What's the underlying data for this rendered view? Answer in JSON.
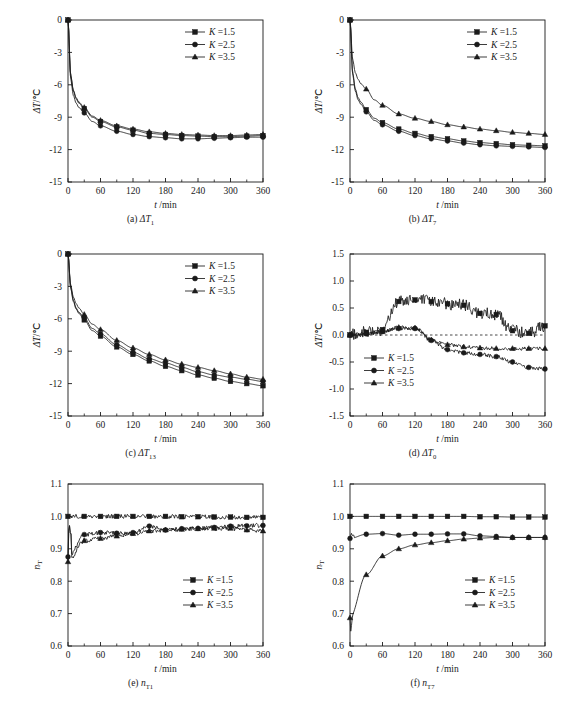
{
  "figure": {
    "width": 563,
    "height": 709,
    "background": "#ffffff",
    "line_color": "#1a1a1a"
  },
  "panels": [
    {
      "id": "a",
      "caption": "(a)",
      "caption_symbol": "ΔT",
      "caption_sub": "1",
      "xlabel_var": "t",
      "xlabel_unit": "/min",
      "ylabel_var": "ΔT",
      "ylabel_unit": "/℃",
      "xticks": [
        "0",
        "60",
        "120",
        "180",
        "240",
        "300",
        "360"
      ],
      "yticks": [
        "0",
        "-3",
        "-6",
        "-9",
        "-12",
        "-15"
      ],
      "legend": [
        "K =1.5",
        "K =2.5",
        "K =3.5"
      ],
      "legend_pos": "top-right"
    },
    {
      "id": "b",
      "caption": "(b)",
      "caption_symbol": "ΔT",
      "caption_sub": "7",
      "xlabel_var": "t",
      "xlabel_unit": "/min",
      "ylabel_var": "ΔT",
      "ylabel_unit": "/℃",
      "xticks": [
        "0",
        "60",
        "120",
        "180",
        "240",
        "300",
        "360"
      ],
      "yticks": [
        "0",
        "-3",
        "-6",
        "-9",
        "-12",
        "-15"
      ],
      "legend": [
        "K =1.5",
        "K =2.5",
        "K =3.5"
      ],
      "legend_pos": "top-right"
    },
    {
      "id": "c",
      "caption": "(c)",
      "caption_symbol": "ΔT",
      "caption_sub": "13",
      "xlabel_var": "t",
      "xlabel_unit": "/min",
      "ylabel_var": "ΔT",
      "ylabel_unit": "/℃",
      "xticks": [
        "0",
        "60",
        "120",
        "180",
        "240",
        "300",
        "360"
      ],
      "yticks": [
        "0",
        "-3",
        "-6",
        "-9",
        "-12",
        "-15"
      ],
      "legend": [
        "K =1.5",
        "K =2.5",
        "K =3.5"
      ],
      "legend_pos": "top-right"
    },
    {
      "id": "d",
      "caption": "(d)",
      "caption_symbol": "ΔT",
      "caption_sub": "0",
      "xlabel_var": "t",
      "xlabel_unit": "/min",
      "ylabel_var": "ΔT",
      "ylabel_unit": "/℃",
      "xticks": [
        "0",
        "60",
        "120",
        "180",
        "240",
        "300",
        "360"
      ],
      "yticks": [
        "1.5",
        "1.0",
        "0.5",
        "0.0",
        "-0.5",
        "-1.0",
        "-1.5"
      ],
      "legend": [
        "K =1.5",
        "K =2.5",
        "K =3.5"
      ],
      "legend_pos": "mid-left"
    },
    {
      "id": "e",
      "caption": "(e)",
      "caption_symbol": "n",
      "caption_sub": "T1",
      "xlabel_var": "t",
      "xlabel_unit": "/min",
      "ylabel_var": "n",
      "ylabel_sub": "T",
      "ylabel_unit": "",
      "xticks": [
        "0",
        "60",
        "120",
        "180",
        "240",
        "300",
        "360"
      ],
      "yticks": [
        "1.1",
        "1.0",
        "0.9",
        "0.8",
        "0.7",
        "0.6"
      ],
      "legend": [
        "K =1.5",
        "K =2.5",
        "K =3.5"
      ],
      "legend_pos": "mid-right"
    },
    {
      "id": "f",
      "caption": "(f)",
      "caption_symbol": "n",
      "caption_sub": "T7",
      "xlabel_var": "t",
      "xlabel_unit": "/min",
      "ylabel_var": "n",
      "ylabel_sub": "T",
      "ylabel_unit": "",
      "xticks": [
        "0",
        "60",
        "120",
        "180",
        "240",
        "300",
        "360"
      ],
      "yticks": [
        "1.1",
        "1.0",
        "0.9",
        "0.8",
        "0.7",
        "0.6"
      ],
      "legend": [
        "K =1.5",
        "K =2.5",
        "K =3.5"
      ],
      "legend_pos": "mid-right"
    }
  ],
  "chart_data": [
    {
      "id": "a",
      "type": "line",
      "title": "(a) ΔT1",
      "xlabel": "t /min",
      "ylabel": "ΔT /℃",
      "xlim": [
        0,
        360
      ],
      "ylim": [
        -15,
        0
      ],
      "grid": false,
      "legend_position": "top right",
      "x": [
        0,
        5,
        10,
        15,
        20,
        30,
        45,
        60,
        90,
        120,
        150,
        180,
        210,
        240,
        270,
        300,
        330,
        360
      ],
      "series": [
        {
          "name": "K =1.5",
          "marker": "square",
          "values": [
            0,
            -5.2,
            -6.6,
            -7.3,
            -7.7,
            -8.2,
            -9.0,
            -9.4,
            -9.9,
            -10.2,
            -10.5,
            -10.6,
            -10.7,
            -10.75,
            -10.8,
            -10.8,
            -10.75,
            -10.7
          ]
        },
        {
          "name": "K =2.5",
          "marker": "circle",
          "values": [
            0,
            -5.5,
            -7.0,
            -7.7,
            -8.1,
            -8.6,
            -9.4,
            -9.8,
            -10.3,
            -10.6,
            -10.8,
            -10.9,
            -11.0,
            -11.0,
            -10.95,
            -10.9,
            -10.85,
            -10.85
          ]
        },
        {
          "name": "K =3.5",
          "marker": "triangle",
          "values": [
            0,
            -5.1,
            -6.5,
            -7.2,
            -7.6,
            -8.1,
            -8.9,
            -9.3,
            -9.8,
            -10.1,
            -10.35,
            -10.5,
            -10.6,
            -10.65,
            -10.7,
            -10.7,
            -10.65,
            -10.6
          ]
        }
      ]
    },
    {
      "id": "b",
      "type": "line",
      "title": "(b) ΔT7",
      "xlabel": "t /min",
      "ylabel": "ΔT /℃",
      "xlim": [
        0,
        360
      ],
      "ylim": [
        -15,
        0
      ],
      "grid": false,
      "legend_position": "top right",
      "x": [
        0,
        5,
        10,
        15,
        20,
        30,
        45,
        60,
        90,
        120,
        150,
        180,
        210,
        240,
        270,
        300,
        330,
        360
      ],
      "series": [
        {
          "name": "K =1.5",
          "marker": "square",
          "values": [
            0,
            -4.9,
            -6.4,
            -7.2,
            -7.6,
            -8.3,
            -9.1,
            -9.5,
            -10.1,
            -10.5,
            -10.8,
            -11.0,
            -11.2,
            -11.35,
            -11.45,
            -11.55,
            -11.6,
            -11.65
          ]
        },
        {
          "name": "K =2.5",
          "marker": "circle",
          "values": [
            0,
            -5.1,
            -6.6,
            -7.4,
            -7.8,
            -8.5,
            -9.3,
            -9.7,
            -10.3,
            -10.7,
            -11.0,
            -11.2,
            -11.4,
            -11.55,
            -11.65,
            -11.7,
            -11.75,
            -11.8
          ]
        },
        {
          "name": "K =3.5",
          "marker": "triangle",
          "values": [
            0,
            -3.7,
            -4.9,
            -5.5,
            -5.9,
            -6.4,
            -7.4,
            -7.9,
            -8.7,
            -9.1,
            -9.4,
            -9.7,
            -9.9,
            -10.1,
            -10.25,
            -10.4,
            -10.5,
            -10.6
          ]
        }
      ]
    },
    {
      "id": "c",
      "type": "line",
      "title": "(c) ΔT13",
      "xlabel": "t /min",
      "ylabel": "ΔT /℃",
      "xlim": [
        0,
        360
      ],
      "ylim": [
        -15,
        0
      ],
      "grid": false,
      "legend_position": "top right",
      "x": [
        0,
        5,
        10,
        15,
        20,
        30,
        45,
        60,
        90,
        120,
        150,
        180,
        210,
        240,
        270,
        300,
        330,
        360
      ],
      "series": [
        {
          "name": "K =1.5",
          "marker": "square",
          "values": [
            0,
            -3.2,
            -4.4,
            -5.1,
            -5.5,
            -6.1,
            -7.1,
            -7.6,
            -8.6,
            -9.3,
            -9.9,
            -10.4,
            -10.8,
            -11.2,
            -11.5,
            -11.8,
            -12.0,
            -12.2
          ]
        },
        {
          "name": "K =2.5",
          "marker": "circle",
          "values": [
            0,
            -3.1,
            -4.3,
            -5.0,
            -5.4,
            -5.9,
            -6.9,
            -7.4,
            -8.4,
            -9.1,
            -9.7,
            -10.1,
            -10.5,
            -10.9,
            -11.2,
            -11.4,
            -11.6,
            -11.8
          ]
        },
        {
          "name": "K =3.5",
          "marker": "triangle",
          "values": [
            0,
            -2.9,
            -4.0,
            -4.6,
            -5.0,
            -5.6,
            -6.5,
            -7.0,
            -8.0,
            -8.7,
            -9.3,
            -9.8,
            -10.2,
            -10.5,
            -10.8,
            -11.1,
            -11.4,
            -11.6
          ]
        }
      ]
    },
    {
      "id": "d",
      "type": "line",
      "title": "(d) ΔT0",
      "xlabel": "t /min",
      "ylabel": "ΔT /℃",
      "xlim": [
        0,
        360
      ],
      "ylim": [
        -1.5,
        1.5
      ],
      "grid": false,
      "zero_line": true,
      "legend_position": "middle left",
      "x": [
        0,
        30,
        60,
        90,
        120,
        150,
        180,
        210,
        240,
        270,
        300,
        330,
        360
      ],
      "series": [
        {
          "name": "K =1.5",
          "marker": "square",
          "values": [
            0.0,
            0.05,
            0.1,
            0.62,
            0.65,
            0.62,
            0.58,
            0.55,
            0.4,
            0.38,
            0.08,
            0.03,
            0.17
          ]
        },
        {
          "name": "K =2.5",
          "marker": "circle",
          "values": [
            0.0,
            0.02,
            0.07,
            0.12,
            0.12,
            -0.1,
            -0.27,
            -0.33,
            -0.36,
            -0.4,
            -0.5,
            -0.6,
            -0.63
          ]
        },
        {
          "name": "K =3.5",
          "marker": "triangle",
          "values": [
            0.0,
            0.03,
            0.06,
            0.14,
            0.13,
            -0.09,
            -0.18,
            -0.22,
            -0.24,
            -0.25,
            -0.25,
            -0.25,
            -0.25
          ]
        }
      ]
    },
    {
      "id": "e",
      "type": "line",
      "title": "(e) nT1",
      "xlabel": "t /min",
      "ylabel": "nT",
      "xlim": [
        0,
        360
      ],
      "ylim": [
        0.6,
        1.1
      ],
      "grid": false,
      "legend_position": "middle right",
      "x": [
        0,
        30,
        60,
        90,
        120,
        150,
        180,
        210,
        240,
        270,
        300,
        330,
        360
      ],
      "series": [
        {
          "name": "K =1.5",
          "marker": "square",
          "values": [
            1.0,
            1.0,
            1.0,
            1.0,
            1.0,
            1.0,
            1.0,
            0.999,
            0.999,
            0.998,
            0.998,
            0.997,
            0.997
          ]
        },
        {
          "name": "K =2.5",
          "marker": "circle",
          "values": [
            0.875,
            0.944,
            0.95,
            0.948,
            0.95,
            0.97,
            0.958,
            0.962,
            0.963,
            0.966,
            0.97,
            0.971,
            0.972
          ]
        },
        {
          "name": "K =3.5",
          "marker": "triangle",
          "values": [
            0.86,
            0.925,
            0.932,
            0.939,
            0.947,
            0.955,
            0.958,
            0.96,
            0.962,
            0.963,
            0.963,
            0.958,
            0.955
          ]
        }
      ]
    },
    {
      "id": "f",
      "type": "line",
      "title": "(f) nT7",
      "xlabel": "t /min",
      "ylabel": "nT",
      "xlim": [
        0,
        360
      ],
      "ylim": [
        0.6,
        1.1
      ],
      "grid": false,
      "legend_position": "middle right",
      "x": [
        0,
        30,
        60,
        90,
        120,
        150,
        180,
        210,
        240,
        270,
        300,
        330,
        360
      ],
      "series": [
        {
          "name": "K =1.5",
          "marker": "square",
          "values": [
            1.0,
            1.0,
            1.0,
            1.0,
            1.0,
            1.0,
            1.0,
            1.0,
            0.999,
            0.999,
            0.998,
            0.998,
            0.998
          ]
        },
        {
          "name": "K =2.5",
          "marker": "circle",
          "values": [
            0.932,
            0.945,
            0.947,
            0.942,
            0.945,
            0.945,
            0.946,
            0.946,
            0.94,
            0.938,
            0.935,
            0.935,
            0.935
          ]
        },
        {
          "name": "K =3.5",
          "marker": "triangle",
          "values": [
            0.687,
            0.82,
            0.878,
            0.9,
            0.912,
            0.919,
            0.925,
            0.93,
            0.933,
            0.935,
            0.935,
            0.935,
            0.935
          ]
        }
      ]
    }
  ]
}
